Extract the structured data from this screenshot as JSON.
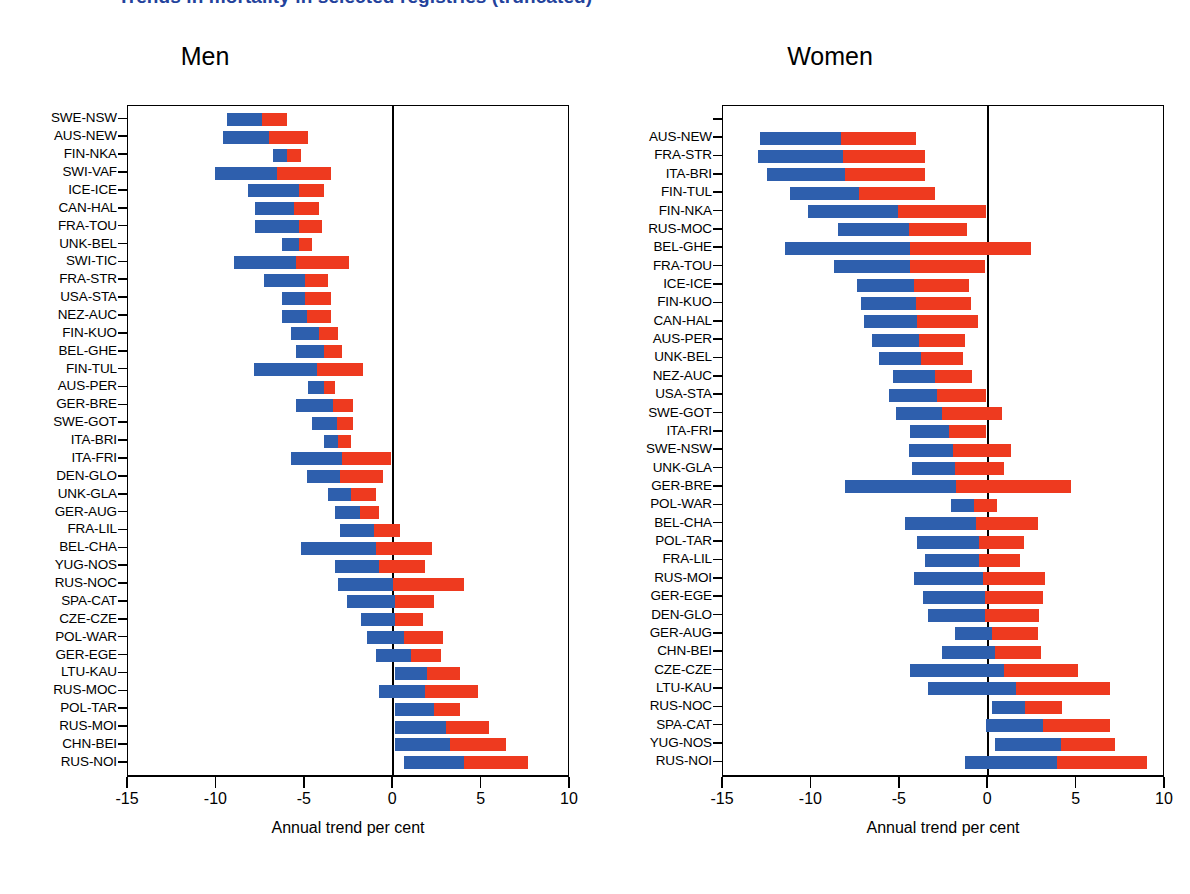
{
  "figure": {
    "suptitle": "Trends in mortality in selected registries (truncated)",
    "xlabel": "Annual trend per cent",
    "colors": {
      "blue": "#2E5FAD",
      "red": "#EE3A1F",
      "axis": "#000000",
      "title": "#23429C"
    }
  },
  "panels": [
    {
      "title": "Men"
    },
    {
      "title": "Women"
    }
  ],
  "axis": {
    "ticks": [
      "-15",
      "-10",
      "-5",
      "0",
      "5",
      "10"
    ],
    "values": [
      -15,
      -10,
      -5,
      0,
      5,
      10
    ]
  },
  "chart_data": {
    "type": "bar",
    "title": "Trends in mortality in selected registries (truncated)",
    "xlabel": "Annual trend per cent",
    "ylabel": "",
    "xlim": [
      -15,
      10
    ],
    "grid": false,
    "legend_position": "none",
    "orientation": "horizontal",
    "stacking": "diverging-range",
    "note": "Each row shows two adjacent segments: a blue segment (earlier period trend) and a red segment (later period trend), laid end to end along the annual trend per cent axis.",
    "series": [
      {
        "name": "blue-segment",
        "color": "#2E5FAD"
      },
      {
        "name": "red-segment",
        "color": "#EE3A1F"
      }
    ],
    "panels": [
      {
        "name": "Men",
        "categories": [
          "SWE-NSW",
          "AUS-NEW",
          "FIN-NKA",
          "SWI-VAF",
          "ICE-ICE",
          "CAN-HAL",
          "FRA-TOU",
          "UNK-BEL",
          "SWI-TIC",
          "FRA-STR",
          "USA-STA",
          "NEZ-AUC",
          "FIN-KUO",
          "BEL-GHE",
          "FIN-TUL",
          "AUS-PER",
          "GER-BRE",
          "SWE-GOT",
          "ITA-BRI",
          "ITA-FRI",
          "DEN-GLO",
          "UNK-GLA",
          "GER-AUG",
          "FRA-LIL",
          "BEL-CHA",
          "YUG-NOS",
          "RUS-NOC",
          "SPA-CAT",
          "CZE-CZE",
          "POL-WAR",
          "GER-EGE",
          "LTU-KAU",
          "RUS-MOC",
          "POL-TAR",
          "RUS-MOI",
          "CHN-BEI",
          "RUS-NOI"
        ],
        "bars": [
          {
            "label": "SWE-NSW",
            "blue_start": -9.4,
            "blue_end": -7.4,
            "red_start": -7.4,
            "red_end": -6.0
          },
          {
            "label": "AUS-NEW",
            "blue_start": -9.6,
            "blue_end": -7.0,
            "red_start": -7.0,
            "red_end": -4.8
          },
          {
            "label": "FIN-NKA",
            "blue_start": -6.8,
            "blue_end": -6.0,
            "red_start": -6.0,
            "red_end": -5.2
          },
          {
            "label": "SWI-VAF",
            "blue_start": -10.1,
            "blue_end": -6.6,
            "red_start": -6.6,
            "red_end": -3.5
          },
          {
            "label": "ICE-ICE",
            "blue_start": -8.2,
            "blue_end": -5.3,
            "red_start": -5.3,
            "red_end": -3.9
          },
          {
            "label": "CAN-HAL",
            "blue_start": -7.8,
            "blue_end": -5.6,
            "red_start": -5.6,
            "red_end": -4.2
          },
          {
            "label": "FRA-TOU",
            "blue_start": -7.8,
            "blue_end": -5.3,
            "red_start": -5.3,
            "red_end": -4.0
          },
          {
            "label": "UNK-BEL",
            "blue_start": -6.3,
            "blue_end": -5.3,
            "red_start": -5.3,
            "red_end": -4.6
          },
          {
            "label": "SWI-TIC",
            "blue_start": -9.0,
            "blue_end": -5.5,
            "red_start": -5.5,
            "red_end": -2.5
          },
          {
            "label": "FRA-STR",
            "blue_start": -7.3,
            "blue_end": -5.0,
            "red_start": -5.0,
            "red_end": -3.7
          },
          {
            "label": "USA-STA",
            "blue_start": -6.3,
            "blue_end": -5.0,
            "red_start": -5.0,
            "red_end": -3.5
          },
          {
            "label": "NEZ-AUC",
            "blue_start": -6.3,
            "blue_end": -4.9,
            "red_start": -4.9,
            "red_end": -3.5
          },
          {
            "label": "FIN-KUO",
            "blue_start": -5.8,
            "blue_end": -4.2,
            "red_start": -4.2,
            "red_end": -3.1
          },
          {
            "label": "BEL-GHE",
            "blue_start": -5.5,
            "blue_end": -3.9,
            "red_start": -3.9,
            "red_end": -2.9
          },
          {
            "label": "FIN-TUL",
            "blue_start": -7.9,
            "blue_end": -4.3,
            "red_start": -4.3,
            "red_end": -1.7
          },
          {
            "label": "AUS-PER",
            "blue_start": -4.8,
            "blue_end": -3.9,
            "red_start": -3.9,
            "red_end": -3.3
          },
          {
            "label": "GER-BRE",
            "blue_start": -5.5,
            "blue_end": -3.4,
            "red_start": -3.4,
            "red_end": -2.3
          },
          {
            "label": "SWE-GOT",
            "blue_start": -4.6,
            "blue_end": -3.2,
            "red_start": -3.2,
            "red_end": -2.3
          },
          {
            "label": "ITA-BRI",
            "blue_start": -3.9,
            "blue_end": -3.1,
            "red_start": -3.1,
            "red_end": -2.4
          },
          {
            "label": "ITA-FRI",
            "blue_start": -5.8,
            "blue_end": -2.9,
            "red_start": -2.9,
            "red_end": -0.1
          },
          {
            "label": "DEN-GLO",
            "blue_start": -4.9,
            "blue_end": -3.0,
            "red_start": -3.0,
            "red_end": -0.6
          },
          {
            "label": "UNK-GLA",
            "blue_start": -3.7,
            "blue_end": -2.4,
            "red_start": -2.4,
            "red_end": -1.0
          },
          {
            "label": "GER-AUG",
            "blue_start": -3.3,
            "blue_end": -1.9,
            "red_start": -1.9,
            "red_end": -0.8
          },
          {
            "label": "FRA-LIL",
            "blue_start": -3.0,
            "blue_end": -1.1,
            "red_start": -1.1,
            "red_end": 0.4
          },
          {
            "label": "BEL-CHA",
            "blue_start": -5.2,
            "blue_end": -1.0,
            "red_start": -1.0,
            "red_end": 2.2
          },
          {
            "label": "YUG-NOS",
            "blue_start": -3.3,
            "blue_end": -0.8,
            "red_start": -0.8,
            "red_end": 1.8
          },
          {
            "label": "RUS-NOC",
            "blue_start": -3.1,
            "blue_end": 0.0,
            "red_start": 0.0,
            "red_end": 4.0
          },
          {
            "label": "SPA-CAT",
            "blue_start": -2.6,
            "blue_end": 0.1,
            "red_start": 0.1,
            "red_end": 2.3
          },
          {
            "label": "CZE-CZE",
            "blue_start": -1.8,
            "blue_end": 0.1,
            "red_start": 0.1,
            "red_end": 1.7
          },
          {
            "label": "POL-WAR",
            "blue_start": -1.5,
            "blue_end": 0.6,
            "red_start": 0.6,
            "red_end": 2.8
          },
          {
            "label": "GER-EGE",
            "blue_start": -1.0,
            "blue_end": 1.0,
            "red_start": 1.0,
            "red_end": 2.7
          },
          {
            "label": "LTU-KAU",
            "blue_start": 0.1,
            "blue_end": 1.9,
            "red_start": 1.9,
            "red_end": 3.8
          },
          {
            "label": "RUS-MOC",
            "blue_start": -0.8,
            "blue_end": 1.8,
            "red_start": 1.8,
            "red_end": 4.8
          },
          {
            "label": "POL-TAR",
            "blue_start": 0.1,
            "blue_end": 2.3,
            "red_start": 2.3,
            "red_end": 3.8
          },
          {
            "label": "RUS-MOI",
            "blue_start": 0.1,
            "blue_end": 3.0,
            "red_start": 3.0,
            "red_end": 5.4
          },
          {
            "label": "CHN-BEI",
            "blue_start": 0.1,
            "blue_end": 3.2,
            "red_start": 3.2,
            "red_end": 6.4
          },
          {
            "label": "RUS-NOI",
            "blue_start": 0.6,
            "blue_end": 4.0,
            "red_start": 4.0,
            "red_end": 7.6
          }
        ]
      },
      {
        "name": "Women",
        "categories": [
          "AUS-NEW",
          "FRA-STR",
          "ITA-BRI",
          "FIN-TUL",
          "FIN-NKA",
          "RUS-MOC",
          "BEL-GHE",
          "FRA-TOU",
          "ICE-ICE",
          "FIN-KUO",
          "CAN-HAL",
          "AUS-PER",
          "UNK-BEL",
          "NEZ-AUC",
          "USA-STA",
          "SWE-GOT",
          "ITA-FRI",
          "SWE-NSW",
          "UNK-GLA",
          "GER-BRE",
          "POL-WAR",
          "BEL-CHA",
          "POL-TAR",
          "FRA-LIL",
          "RUS-MOI",
          "GER-EGE",
          "DEN-GLO",
          "GER-AUG",
          "CHN-BEI",
          "CZE-CZE",
          "LTU-KAU",
          "RUS-NOC",
          "SPA-CAT",
          "YUG-NOS",
          "RUS-NOI"
        ],
        "bars": [
          {
            "label": "AUS-NEW",
            "blue_start": -12.9,
            "blue_end": -8.3,
            "red_start": -8.3,
            "red_end": -4.1
          },
          {
            "label": "FRA-STR",
            "blue_start": -13.0,
            "blue_end": -8.2,
            "red_start": -8.2,
            "red_end": -3.6
          },
          {
            "label": "ITA-BRI",
            "blue_start": -12.5,
            "blue_end": -8.1,
            "red_start": -8.1,
            "red_end": -3.6
          },
          {
            "label": "FIN-TUL",
            "blue_start": -11.2,
            "blue_end": -7.3,
            "red_start": -7.3,
            "red_end": -3.0
          },
          {
            "label": "FIN-NKA",
            "blue_start": -10.2,
            "blue_end": -5.1,
            "red_start": -5.1,
            "red_end": -0.1
          },
          {
            "label": "RUS-MOC",
            "blue_start": -8.5,
            "blue_end": -4.5,
            "red_start": -4.5,
            "red_end": -1.2
          },
          {
            "label": "BEL-GHE",
            "blue_start": -11.5,
            "blue_end": -4.4,
            "red_start": -4.4,
            "red_end": 2.4
          },
          {
            "label": "FRA-TOU",
            "blue_start": -8.7,
            "blue_end": -4.4,
            "red_start": -4.4,
            "red_end": -0.2
          },
          {
            "label": "ICE-ICE",
            "blue_start": -7.4,
            "blue_end": -4.2,
            "red_start": -4.2,
            "red_end": -1.1
          },
          {
            "label": "FIN-KUO",
            "blue_start": -7.2,
            "blue_end": -4.1,
            "red_start": -4.1,
            "red_end": -1.0
          },
          {
            "label": "CAN-HAL",
            "blue_start": -7.0,
            "blue_end": -4.0,
            "red_start": -4.0,
            "red_end": -0.6
          },
          {
            "label": "AUS-PER",
            "blue_start": -6.6,
            "blue_end": -3.9,
            "red_start": -3.9,
            "red_end": -1.3
          },
          {
            "label": "UNK-BEL",
            "blue_start": -6.2,
            "blue_end": -3.8,
            "red_start": -3.8,
            "red_end": -1.4
          },
          {
            "label": "NEZ-AUC",
            "blue_start": -5.4,
            "blue_end": -3.0,
            "red_start": -3.0,
            "red_end": -0.9
          },
          {
            "label": "USA-STA",
            "blue_start": -5.6,
            "blue_end": -2.9,
            "red_start": -2.9,
            "red_end": -0.1
          },
          {
            "label": "SWE-GOT",
            "blue_start": -5.2,
            "blue_end": -2.6,
            "red_start": -2.6,
            "red_end": 0.8
          },
          {
            "label": "ITA-FRI",
            "blue_start": -4.4,
            "blue_end": -2.2,
            "red_start": -2.2,
            "red_end": -0.1
          },
          {
            "label": "SWE-NSW",
            "blue_start": -4.5,
            "blue_end": -2.0,
            "red_start": -2.0,
            "red_end": 1.3
          },
          {
            "label": "UNK-GLA",
            "blue_start": -4.3,
            "blue_end": -1.9,
            "red_start": -1.9,
            "red_end": 0.9
          },
          {
            "label": "GER-BRE",
            "blue_start": -8.1,
            "blue_end": -1.8,
            "red_start": -1.8,
            "red_end": 4.7
          },
          {
            "label": "POL-WAR",
            "blue_start": -2.1,
            "blue_end": -0.8,
            "red_start": -0.8,
            "red_end": 0.5
          },
          {
            "label": "BEL-CHA",
            "blue_start": -4.7,
            "blue_end": -0.7,
            "red_start": -0.7,
            "red_end": 2.8
          },
          {
            "label": "POL-TAR",
            "blue_start": -4.0,
            "blue_end": -0.5,
            "red_start": -0.5,
            "red_end": 2.0
          },
          {
            "label": "FRA-LIL",
            "blue_start": -3.6,
            "blue_end": -0.5,
            "red_start": -0.5,
            "red_end": 1.8
          },
          {
            "label": "RUS-MOI",
            "blue_start": -4.2,
            "blue_end": -0.3,
            "red_start": -0.3,
            "red_end": 3.2
          },
          {
            "label": "GER-EGE",
            "blue_start": -3.7,
            "blue_end": -0.2,
            "red_start": -0.2,
            "red_end": 3.1
          },
          {
            "label": "DEN-GLO",
            "blue_start": -3.4,
            "blue_end": -0.2,
            "red_start": -0.2,
            "red_end": 2.9
          },
          {
            "label": "GER-AUG",
            "blue_start": -1.9,
            "blue_end": 0.2,
            "red_start": 0.2,
            "red_end": 2.8
          },
          {
            "label": "CHN-BEI",
            "blue_start": -2.6,
            "blue_end": 0.4,
            "red_start": 0.4,
            "red_end": 3.0
          },
          {
            "label": "CZE-CZE",
            "blue_start": -4.4,
            "blue_end": 0.9,
            "red_start": 0.9,
            "red_end": 5.1
          },
          {
            "label": "LTU-KAU",
            "blue_start": -3.4,
            "blue_end": 1.6,
            "red_start": 1.6,
            "red_end": 6.9
          },
          {
            "label": "RUS-NOC",
            "blue_start": 0.2,
            "blue_end": 2.1,
            "red_start": 2.1,
            "red_end": 4.2
          },
          {
            "label": "SPA-CAT",
            "blue_start": -0.1,
            "blue_end": 3.1,
            "red_start": 3.1,
            "red_end": 6.9
          },
          {
            "label": "YUG-NOS",
            "blue_start": 0.4,
            "blue_end": 4.1,
            "red_start": 4.1,
            "red_end": 7.2
          },
          {
            "label": "RUS-NOI",
            "blue_start": -1.3,
            "blue_end": 3.9,
            "red_start": 3.9,
            "red_end": 9.0
          }
        ]
      }
    ]
  }
}
